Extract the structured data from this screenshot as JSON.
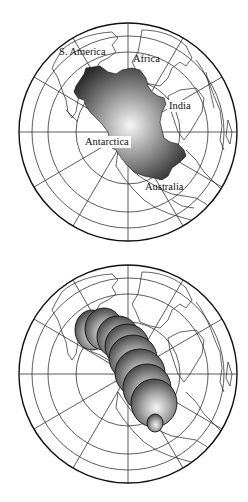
{
  "figure": {
    "top_panel": {
      "description": "Polar projection globe with reconstructed shaded region over Antarctica",
      "labels": {
        "s_america": "S. America",
        "africa": "Africa",
        "india": "India",
        "antarctica": "Antarctica",
        "australia": "Australia"
      }
    },
    "bottom_panel": {
      "description": "Same polar projection with a chain of shaded spheres of varying size",
      "sphere_count": 9
    },
    "colors": {
      "background": "#ffffff",
      "lines": "#222222",
      "shade_dark": "#2a2a2a",
      "shade_light": "#f4f4f4"
    }
  }
}
